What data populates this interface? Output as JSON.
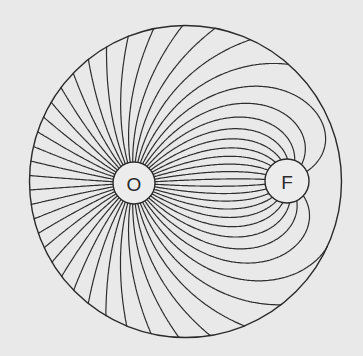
{
  "diagram": {
    "type": "field-lines",
    "background": "#e9e9e9",
    "stroke_color": "#2e2e2e",
    "boundary": {
      "cx": 185.5,
      "cy": 181.5,
      "r": 156
    },
    "source": {
      "label": "O",
      "cx": 134,
      "cy": 183,
      "r": 21,
      "strength": 1.0
    },
    "sink": {
      "label": "F",
      "cx": 287,
      "cy": 181,
      "r": 22,
      "strength": 0.42
    },
    "line_count": 52
  }
}
